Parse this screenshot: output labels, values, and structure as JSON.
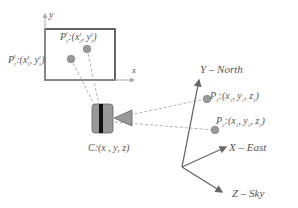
{
  "image_plane": {
    "axis_y_label": "y",
    "axis_x_label": "x",
    "p1_label": "P",
    "p1_sup": "I",
    "p1_sub": "1",
    "p1_coords": ":(x",
    "p1_coords_rest": ", y",
    "p1_close": ")",
    "p2_label": "P",
    "p2_sup": "I",
    "p2_sub": "2",
    "p2_coords": ":(x",
    "p2_coords_rest": ", y",
    "p2_close": ")"
  },
  "camera": {
    "label": "C:(x , y, z)"
  },
  "world": {
    "y_axis_label": "Y – North",
    "x_axis_label": "X – East",
    "z_axis_label": "Z – Sky",
    "p1_label": "P",
    "p1_sub": "1",
    "p1_coords": ":(x",
    "p1_rest": ", y",
    "p1_rest2": ", z",
    "p2_label": "P",
    "p2_sub": "2",
    "p2_coords": ":(x",
    "p2_rest": ", y",
    "p2_rest2": ", z"
  },
  "colors": {
    "line": "#555555",
    "point": "#999999",
    "dash": "#aaaaaa"
  }
}
